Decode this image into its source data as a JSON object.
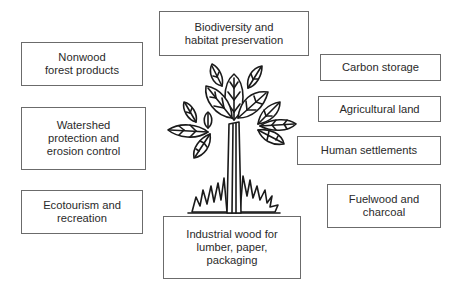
{
  "diagram": {
    "center_icon": "tree-icon",
    "stroke_color": "#1a1a1a",
    "box_border_color": "#6b6b6b",
    "boxes": {
      "biodiversity": "Biodiversity and\nhabitat preservation",
      "nonwood": "Nonwood\nforest products",
      "watershed": "Watershed\nprotection and\nerosion control",
      "ecotourism": "Ecotourism and\nrecreation",
      "industrial": "Industrial wood for\nlumber, paper,\npackaging",
      "carbon": "Carbon storage",
      "agricultural": "Agricultural land",
      "human": "Human settlements",
      "fuelwood": "Fuelwood and\ncharcoal"
    }
  }
}
